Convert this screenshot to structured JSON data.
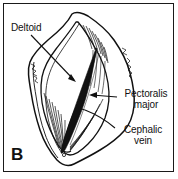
{
  "figure": {
    "panel_label": "B",
    "type": "anatomical line drawing",
    "frame_color": "#1a1a1a",
    "background_color": "#ffffff",
    "ink_color": "#111111"
  },
  "labels": {
    "deltoid": "Deltoid",
    "pectoralis_line1": "Pectoralis",
    "pectoralis_line2": "major",
    "cephalic_line1": "Cephalic",
    "cephalic_line2": "vein"
  }
}
